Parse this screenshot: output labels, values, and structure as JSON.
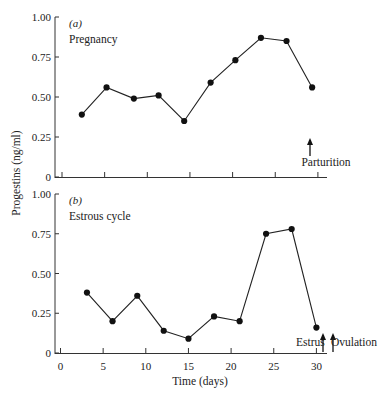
{
  "chart_data": [
    {
      "type": "line",
      "panel": "(a)",
      "title": "Pregnancy",
      "xlabel": "",
      "ylabel": "Progestins (ng/ml)",
      "xlim": [
        0,
        31
      ],
      "ylim": [
        0,
        1.0
      ],
      "xticks": [
        0,
        5,
        10,
        15,
        20,
        25,
        30
      ],
      "xtick_labels_visible": false,
      "yticks": [
        0,
        0.25,
        0.5,
        0.75,
        1.0
      ],
      "ytick_labels": [
        "0",
        "0.25",
        "0.50",
        "0.75",
        "1.00"
      ],
      "grid": false,
      "series": [
        {
          "name": "Pregnancy",
          "x": [
            2.5,
            5.4,
            8.6,
            11.5,
            14.5,
            17.6,
            20.5,
            23.5,
            26.5,
            29.5
          ],
          "values": [
            0.39,
            0.56,
            0.49,
            0.51,
            0.35,
            0.59,
            0.73,
            0.87,
            0.85,
            0.56
          ]
        }
      ],
      "annotations": [
        {
          "text": "Parturition",
          "x": 29.5,
          "type": "arrow-up"
        }
      ]
    },
    {
      "type": "line",
      "panel": "(b)",
      "title": "Estrous cycle",
      "xlabel": "Time (days)",
      "ylabel": "Progestins (ng/ml)",
      "xlim": [
        0,
        31
      ],
      "ylim": [
        0,
        1.0
      ],
      "xticks": [
        0,
        5,
        10,
        15,
        20,
        25,
        30
      ],
      "xtick_labels": [
        "0",
        "5",
        "10",
        "15",
        "20",
        "25",
        "30"
      ],
      "yticks": [
        0,
        0.25,
        0.5,
        0.75,
        1.0
      ],
      "ytick_labels": [
        "0",
        "0.25",
        "0.50",
        "0.75",
        "1.00"
      ],
      "grid": false,
      "series": [
        {
          "name": "Estrous cycle",
          "x": [
            3.1,
            6.1,
            9.0,
            12.1,
            15.0,
            18.0,
            21.0,
            24.1,
            27.1,
            30.0
          ],
          "values": [
            0.38,
            0.2,
            0.36,
            0.14,
            0.09,
            0.23,
            0.2,
            0.75,
            0.78,
            0.16
          ]
        }
      ],
      "annotations": [
        {
          "text": "Estrus",
          "x": 30.8,
          "type": "arrow-up"
        },
        {
          "text": "Ovulation",
          "x": 32.0,
          "type": "arrow-up"
        }
      ]
    }
  ],
  "labels": {
    "ylabel": "Progestins (ng/ml)",
    "xlabel": "Time (days)",
    "panel_a_tag": "(a)",
    "panel_a_title": "Pregnancy",
    "panel_b_tag": "(b)",
    "panel_b_title": "Estrous cycle",
    "parturition": "Parturition",
    "estrus": "Estrus",
    "ovulation": "Ovulation"
  }
}
